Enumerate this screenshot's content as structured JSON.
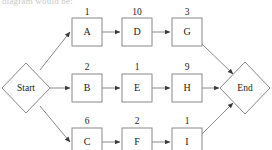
{
  "page": {
    "cut_off_heading": "diagram would be:",
    "background_color": "#ffffff",
    "stroke_color": "#8a8a8a",
    "text_color": "#1b1b1b"
  },
  "diagram": {
    "type": "activity-on-node-network",
    "title": "",
    "start_node": {
      "id": "start",
      "label": "Start",
      "shape": "diamond",
      "cx": 26,
      "cy": 88,
      "rx": 24,
      "ry": 25
    },
    "end_node": {
      "id": "end",
      "label": "End",
      "shape": "diamond",
      "cx": 245,
      "cy": 88,
      "rx": 25,
      "ry": 26
    },
    "rows": [
      {
        "row": "top",
        "nodes": [
          {
            "id": "A",
            "label": "A",
            "duration": "1",
            "x": 72,
            "y": 18,
            "w": 30,
            "h": 28
          },
          {
            "id": "D",
            "label": "D",
            "duration": "10",
            "x": 122,
            "y": 18,
            "w": 30,
            "h": 28
          },
          {
            "id": "G",
            "label": "G",
            "duration": "3",
            "x": 172,
            "y": 18,
            "w": 30,
            "h": 28
          }
        ]
      },
      {
        "row": "middle",
        "nodes": [
          {
            "id": "B",
            "label": "B",
            "duration": "2",
            "x": 72,
            "y": 74,
            "w": 30,
            "h": 28
          },
          {
            "id": "E",
            "label": "E",
            "duration": "1",
            "x": 122,
            "y": 74,
            "w": 30,
            "h": 28
          },
          {
            "id": "H",
            "label": "H",
            "duration": "9",
            "x": 172,
            "y": 74,
            "w": 30,
            "h": 28
          }
        ]
      },
      {
        "row": "bottom",
        "nodes": [
          {
            "id": "C",
            "label": "C",
            "duration": "6",
            "x": 72,
            "y": 128,
            "w": 30,
            "h": 28
          },
          {
            "id": "F",
            "label": "F",
            "duration": "2",
            "x": 122,
            "y": 128,
            "w": 30,
            "h": 28
          },
          {
            "id": "I",
            "label": "I",
            "duration": "1",
            "x": 172,
            "y": 128,
            "w": 30,
            "h": 28
          }
        ]
      }
    ],
    "edges": [
      {
        "from": "start",
        "to": "A",
        "kind": "diagonal-up"
      },
      {
        "from": "start",
        "to": "B",
        "kind": "horizontal"
      },
      {
        "from": "start",
        "to": "C",
        "kind": "diagonal-down"
      },
      {
        "from": "A",
        "to": "D",
        "kind": "horizontal"
      },
      {
        "from": "D",
        "to": "G",
        "kind": "horizontal"
      },
      {
        "from": "B",
        "to": "E",
        "kind": "horizontal"
      },
      {
        "from": "E",
        "to": "H",
        "kind": "horizontal"
      },
      {
        "from": "C",
        "to": "F",
        "kind": "horizontal"
      },
      {
        "from": "F",
        "to": "I",
        "kind": "horizontal"
      },
      {
        "from": "G",
        "to": "end",
        "kind": "diagonal-down"
      },
      {
        "from": "H",
        "to": "end",
        "kind": "horizontal"
      },
      {
        "from": "I",
        "to": "end",
        "kind": "diagonal-up"
      }
    ]
  }
}
